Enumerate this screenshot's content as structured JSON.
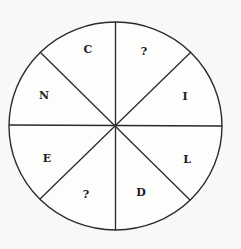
{
  "puzzle": {
    "type": "letter-wheel",
    "segment_count": 8,
    "colors": {
      "line": "#2a2a2a",
      "text": "#1e1e1e",
      "background": "#f8f8f6"
    },
    "segments": [
      {
        "position": "top-left",
        "label": "C"
      },
      {
        "position": "top-right",
        "label": "?"
      },
      {
        "position": "right-upper",
        "label": "I"
      },
      {
        "position": "right-lower",
        "label": "L"
      },
      {
        "position": "bottom-right",
        "label": "D"
      },
      {
        "position": "bottom-left",
        "label": "?"
      },
      {
        "position": "left-lower",
        "label": "E"
      },
      {
        "position": "left-upper",
        "label": "N"
      }
    ]
  }
}
